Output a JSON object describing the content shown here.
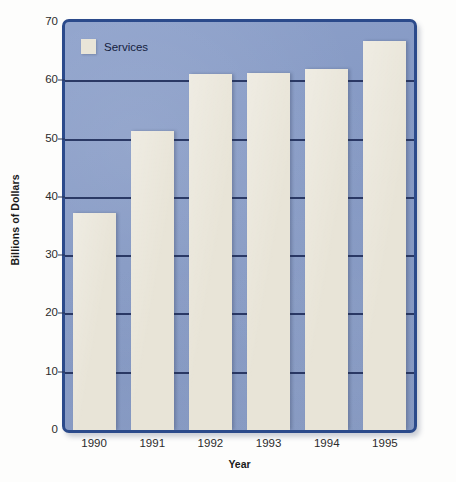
{
  "chart_data": {
    "type": "bar",
    "title": "",
    "xlabel": "Year",
    "ylabel": "Billions of Dollars",
    "categories": [
      "1990",
      "1991",
      "1992",
      "1993",
      "1994",
      "1995"
    ],
    "series": [
      {
        "name": "Services",
        "values": [
          37.3,
          51.3,
          61,
          61.3,
          62,
          66.8
        ]
      }
    ],
    "ylim": [
      0,
      70
    ],
    "yticks": [
      0,
      10,
      20,
      30,
      40,
      50,
      60,
      70
    ],
    "ytick_labels": [
      "0",
      "10",
      "20",
      "30",
      "40",
      "50",
      "60",
      "70"
    ],
    "grid": true,
    "grid_axis": "y",
    "legend": {
      "position": "top-left",
      "entries": [
        "Services"
      ]
    },
    "colors": {
      "bar": "#e8e4d7",
      "plot_background": "#7f95c4",
      "plot_border": "#2b4a8b",
      "gridline": "#22305c",
      "axis_text": "#2b2b2b",
      "page_background": "#fdfdfc"
    }
  }
}
